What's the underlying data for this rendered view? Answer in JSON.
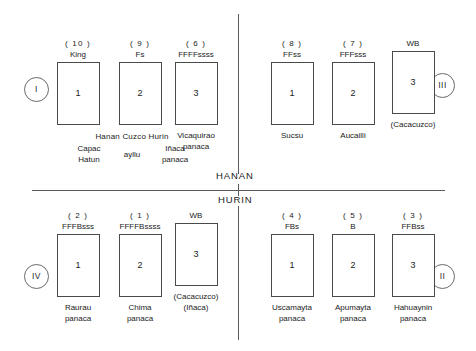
{
  "figure": {
    "divider_labels": {
      "upper": "HANAN",
      "lower": "HURIN"
    }
  },
  "quadrants": [
    {
      "id": "I",
      "badge": "I",
      "cells": [
        {
          "rank": "( 10 )",
          "code": "King",
          "number": "1",
          "caption": ""
        },
        {
          "rank": "( 9 )",
          "code": "Fs",
          "number": "2",
          "caption": ""
        },
        {
          "rank": "( 6 )",
          "code": "FFFFssss",
          "number": "3",
          "caption": "Vicaquirao\npanaca"
        }
      ],
      "ayllu_caption": {
        "row1": "Hanan  Cuzco  Hurin",
        "left": "Capac\nHatun",
        "middle": "ayllu",
        "right": "Iñaca\npanaca"
      }
    },
    {
      "id": "III",
      "badge": "III",
      "cells": [
        {
          "rank": "( 8 )",
          "code": "FFss",
          "number": "1",
          "caption": "Sucsu"
        },
        {
          "rank": "( 7 )",
          "code": "FFFsss",
          "number": "2",
          "caption": "Aucailli"
        },
        {
          "rank": "",
          "code": "WB",
          "number": "3",
          "caption": "(Cacacuzco)"
        }
      ]
    },
    {
      "id": "IV",
      "badge": "IV",
      "cells": [
        {
          "rank": "( 2 )",
          "code": "FFFBsss",
          "number": "1",
          "caption": "Raurau\npanaca"
        },
        {
          "rank": "( 1 )",
          "code": "FFFFBssss",
          "number": "2",
          "caption": "Chima\npanaca"
        },
        {
          "rank": "",
          "code": "WB",
          "number": "3",
          "caption": "(Cacacuzco)\n(Iñaca)"
        }
      ]
    },
    {
      "id": "II",
      "badge": "II",
      "cells": [
        {
          "rank": "( 4 )",
          "code": "FBs",
          "number": "1",
          "caption": "Uscamayta\npanaca"
        },
        {
          "rank": "( 5 )",
          "code": "B",
          "number": "2",
          "caption": "Apumayta\npanaca"
        },
        {
          "rank": "( 3 )",
          "code": "FFBss",
          "number": "3",
          "caption": "Hahuaynin\npanaca"
        }
      ]
    }
  ]
}
